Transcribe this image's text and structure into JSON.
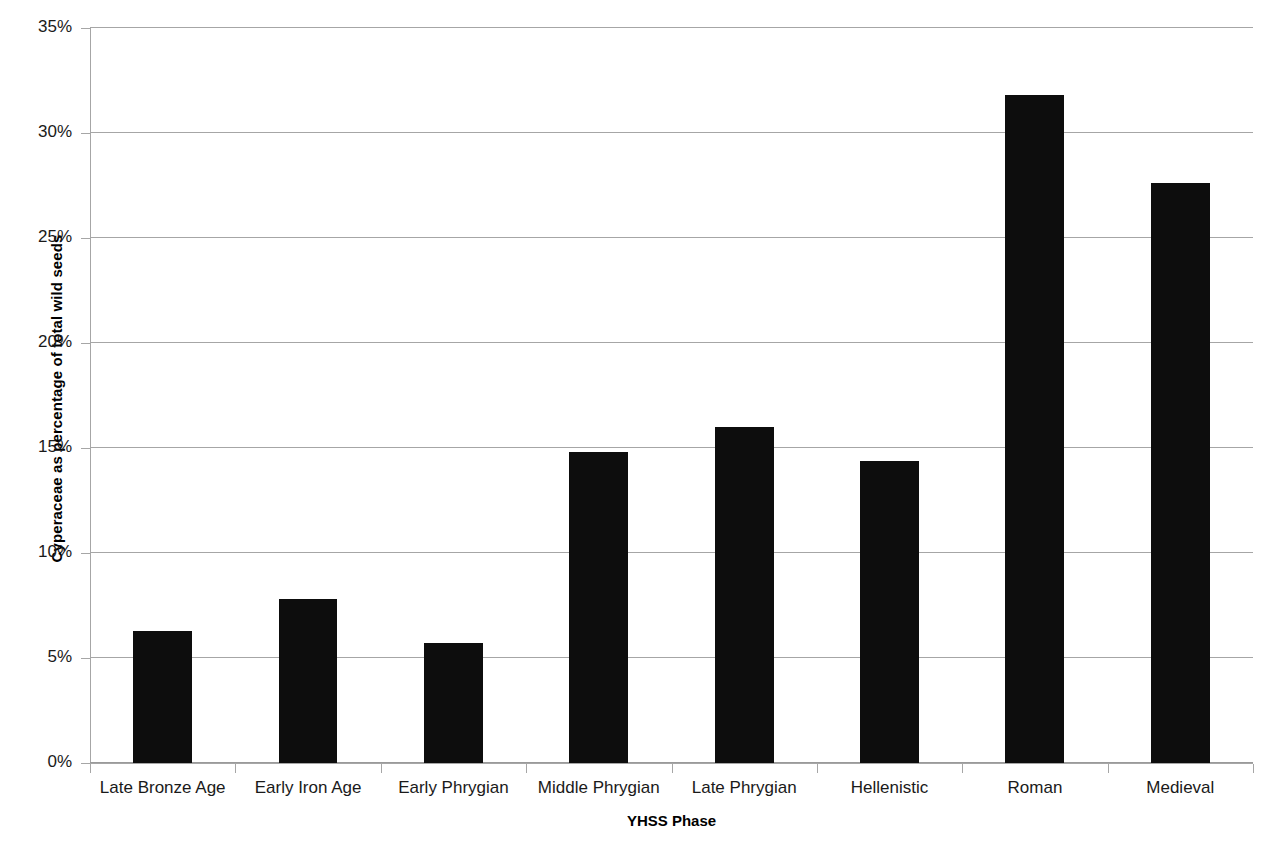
{
  "chart_data": {
    "type": "bar",
    "title": "",
    "xlabel": "YHSS Phase",
    "ylabel": "Cyperaceae as percentage of total wild seeds",
    "categories": [
      "Late Bronze Age",
      "Early Iron Age",
      "Early Phrygian",
      "Middle Phrygian",
      "Late Phrygian",
      "Hellenistic",
      "Roman",
      "Medieval"
    ],
    "values": [
      6.3,
      7.8,
      5.7,
      14.8,
      16.0,
      14.4,
      31.8,
      27.6
    ],
    "ylim": [
      0,
      35
    ],
    "ytick_values": [
      0,
      5,
      10,
      15,
      20,
      25,
      30,
      35
    ],
    "ytick_labels": [
      "0%",
      "5%",
      "10%",
      "15%",
      "20%",
      "25%",
      "30%",
      "35%"
    ],
    "grid": true,
    "legend": false,
    "legend_position": "none",
    "bar_color": "#0d0d0d",
    "gridline_color": "#a6a6a6",
    "axis_color": "#a6a6a6",
    "background_color": "#ffffff",
    "value_unit": "%"
  }
}
